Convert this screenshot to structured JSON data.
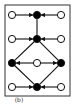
{
  "diagram": {
    "caption": "(b)",
    "frame": {
      "x": 5,
      "y": 5,
      "w": 65,
      "h": 91
    },
    "colors": {
      "stroke": "#111111",
      "fill_filled": "#000000",
      "fill_open": "#ffffff",
      "background": "#ffffff"
    },
    "nodes": [
      {
        "id": "r1-left",
        "x": 12,
        "y": 15,
        "filled": false
      },
      {
        "id": "r1-mid",
        "x": 37,
        "y": 15,
        "filled": true
      },
      {
        "id": "r1-right",
        "x": 61,
        "y": 15,
        "filled": false
      },
      {
        "id": "r2-left",
        "x": 12,
        "y": 39,
        "filled": false
      },
      {
        "id": "r2-mid",
        "x": 37,
        "y": 39,
        "filled": true
      },
      {
        "id": "r2-right",
        "x": 61,
        "y": 39,
        "filled": false
      },
      {
        "id": "r3-left",
        "x": 12,
        "y": 63,
        "filled": true
      },
      {
        "id": "r3-mid",
        "x": 37,
        "y": 63,
        "filled": false
      },
      {
        "id": "r3-right",
        "x": 61,
        "y": 63,
        "filled": true
      },
      {
        "id": "r4-left",
        "x": 12,
        "y": 87,
        "filled": false
      },
      {
        "id": "r4-mid",
        "x": 37,
        "y": 87,
        "filled": true
      },
      {
        "id": "r4-right",
        "x": 61,
        "y": 87,
        "filled": false
      }
    ],
    "edges": [
      {
        "from": "r1-left",
        "to": "r1-mid",
        "arrow": true
      },
      {
        "from": "r1-right",
        "to": "r1-mid",
        "arrow": true
      },
      {
        "from": "r1-mid",
        "to": "r2-mid",
        "arrow": false
      },
      {
        "from": "r2-left",
        "to": "r2-mid",
        "arrow": true
      },
      {
        "from": "r2-right",
        "to": "r2-mid",
        "arrow": true
      },
      {
        "from": "r2-mid",
        "to": "r3-left",
        "arrow": false
      },
      {
        "from": "r2-mid",
        "to": "r3-right",
        "arrow": false
      },
      {
        "from": "r3-mid",
        "to": "r3-left",
        "arrow": true
      },
      {
        "from": "r3-mid",
        "to": "r3-right",
        "arrow": true
      },
      {
        "from": "r3-left",
        "to": "r4-mid",
        "arrow": false
      },
      {
        "from": "r3-right",
        "to": "r4-mid",
        "arrow": false
      },
      {
        "from": "r4-left",
        "to": "r4-mid",
        "arrow": true
      },
      {
        "from": "r4-right",
        "to": "r4-mid",
        "arrow": true
      }
    ]
  }
}
